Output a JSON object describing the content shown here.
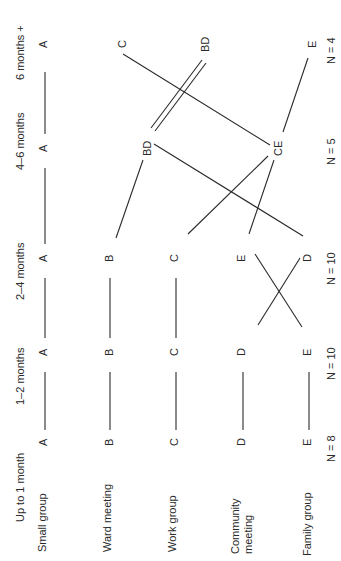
{
  "diagram": {
    "orientation": "rotated-90-ccw",
    "periods": [
      {
        "label": "Up to 1 month",
        "n_label": "N = 8"
      },
      {
        "label": "1–2 months",
        "n_label": "N = 10"
      },
      {
        "label": "2–4 months",
        "n_label": "N = 10"
      },
      {
        "label": "4–6 months",
        "n_label": "N = 5"
      },
      {
        "label": "6 months +",
        "n_label": "N = 4"
      }
    ],
    "groups": [
      {
        "code": "A",
        "label": "Small group"
      },
      {
        "code": "B",
        "label": "Ward meeting"
      },
      {
        "code": "C",
        "label": "Work group"
      },
      {
        "code": "D",
        "label": "Community meeting",
        "label_line1": "Community",
        "label_line2": "meeting"
      },
      {
        "code": "E",
        "label": "Family group"
      }
    ],
    "rankings": [
      [
        "A",
        "B",
        "C",
        "D",
        "E"
      ],
      [
        "A",
        "B",
        "C",
        "D",
        "E"
      ],
      [
        "A",
        "B",
        "C",
        "E",
        "D"
      ],
      [
        "A",
        "BD",
        "CE"
      ],
      [
        "A",
        "C",
        "BD",
        "E"
      ]
    ],
    "nodes": {
      "p0": [
        "A",
        "B",
        "C",
        "D",
        "E"
      ],
      "p1": [
        "A",
        "B",
        "C",
        "D",
        "E"
      ],
      "p2": [
        "A",
        "B",
        "C",
        "E",
        "D"
      ],
      "p3": [
        "A",
        "BD",
        "CE"
      ],
      "p4": [
        "A",
        "C",
        "BD",
        "E"
      ]
    }
  }
}
